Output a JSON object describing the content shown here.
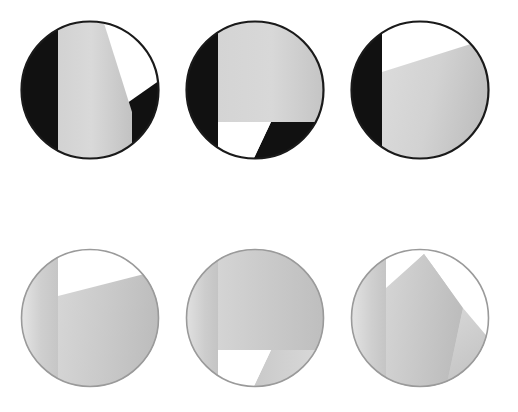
{
  "figure": {
    "title": "",
    "background_color": "#ffffff",
    "width": 518,
    "height": 412,
    "rows": 2,
    "columns": 3
  },
  "palette": {
    "black": "#111111",
    "outline": "#1a1a1a",
    "white": "#ffffff",
    "mid_gray_light": "#d7d7d7",
    "mid_gray_dark": "#bdbdbd",
    "pale_gray_light": "#e6e6e6",
    "pale_gray_dark": "#bcbcbc",
    "faint_gray": "#d0d0d0",
    "background": "#ffffff"
  },
  "panels": [
    {
      "id": "panel-1",
      "name": "top-left-disc",
      "row": 1,
      "column": 1,
      "x": 20,
      "y": 20,
      "size": 140,
      "contrast": "high",
      "regions": [
        {
          "name": "left-lobe",
          "fill": "black"
        },
        {
          "name": "central-band",
          "fill": "mid-gray-gradient"
        },
        {
          "name": "upper-right-wedge",
          "fill": "white"
        },
        {
          "name": "right-lobe",
          "fill": "black"
        }
      ]
    },
    {
      "id": "panel-2",
      "name": "top-center-disc",
      "row": 1,
      "column": 2,
      "x": 185,
      "y": 20,
      "size": 140,
      "contrast": "high",
      "regions": [
        {
          "name": "left-lobe",
          "fill": "black"
        },
        {
          "name": "upper-block",
          "fill": "mid-gray-gradient"
        },
        {
          "name": "lower-left-notch",
          "fill": "white"
        },
        {
          "name": "lower-right-wedge",
          "fill": "black"
        }
      ]
    },
    {
      "id": "panel-3",
      "name": "top-right-disc",
      "row": 1,
      "column": 3,
      "x": 350,
      "y": 20,
      "size": 140,
      "contrast": "high",
      "regions": [
        {
          "name": "left-lobe",
          "fill": "black"
        },
        {
          "name": "upper-wedge",
          "fill": "white"
        },
        {
          "name": "main-body",
          "fill": "mid-gray-gradient"
        }
      ]
    },
    {
      "id": "panel-4",
      "name": "bottom-left-disc",
      "row": 2,
      "column": 1,
      "x": 20,
      "y": 248,
      "size": 140,
      "contrast": "low",
      "regions": [
        {
          "name": "left-lobe",
          "fill": "pale-gray-gradient"
        },
        {
          "name": "central-band",
          "fill": "pale-gray-gradient"
        },
        {
          "name": "upper-right-wedge",
          "fill": "white"
        },
        {
          "name": "right-lobe",
          "fill": "pale-gray-gradient"
        }
      ]
    },
    {
      "id": "panel-5",
      "name": "bottom-center-disc",
      "row": 2,
      "column": 2,
      "x": 185,
      "y": 248,
      "size": 140,
      "contrast": "low",
      "regions": [
        {
          "name": "left-lobe",
          "fill": "pale-gray-gradient"
        },
        {
          "name": "upper-block",
          "fill": "pale-gray-gradient"
        },
        {
          "name": "lower-left-notch",
          "fill": "white"
        },
        {
          "name": "lower-right-wedge",
          "fill": "pale-gray-gradient"
        }
      ]
    },
    {
      "id": "panel-6",
      "name": "bottom-right-disc",
      "row": 2,
      "column": 3,
      "x": 350,
      "y": 248,
      "size": 140,
      "contrast": "low",
      "regions": [
        {
          "name": "left-lobe",
          "fill": "pale-gray-gradient"
        },
        {
          "name": "upper-right-wedge",
          "fill": "white"
        },
        {
          "name": "main-body",
          "fill": "pale-gray-gradient"
        },
        {
          "name": "lower-right-wedge",
          "fill": "pale-gray-gradient"
        }
      ]
    }
  ]
}
